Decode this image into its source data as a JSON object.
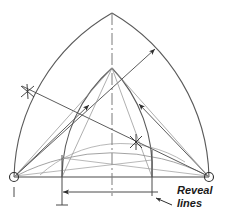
{
  "figure": {
    "type": "technical-line-drawing",
    "width": 225,
    "height": 217,
    "background_color": "#ffffff",
    "line_color": "#4a4a4a",
    "dark_line_color": "#2e2e2e",
    "light_line_color": "#8c8c8c",
    "text_color": "#1a1a1a"
  },
  "annotations": {
    "reveal_label_line1": "Reveal",
    "reveal_label_line2": "lines"
  },
  "geometry": {
    "baseline": {
      "y": 177,
      "x_left": 14,
      "x_right": 209
    },
    "centerline": {
      "x": 112,
      "y_top": 13,
      "y_bottom": 196
    },
    "apex": {
      "x": 112,
      "y": 13
    },
    "inner_apex": {
      "x": 112,
      "y": 68
    },
    "left_center": {
      "x": 14,
      "y": 177
    },
    "right_center": {
      "x": 209,
      "y": 177
    },
    "left_reveal": {
      "x": 62,
      "y": 177
    },
    "right_reveal": {
      "x": 152,
      "y": 177
    },
    "dimension_line_y": 192,
    "extension_bottom_y": 205
  },
  "markers": {
    "center_dot_radius": 4.5,
    "tick_cross_positions": [
      {
        "x": 28,
        "y": 92
      },
      {
        "x": 136,
        "y": 142
      }
    ],
    "arrowheads": [
      {
        "x": 152,
        "y": 52,
        "label": "outer-radius-arrow-right"
      },
      {
        "x": 86,
        "y": 108,
        "label": "inner-radius-arrow-left"
      },
      {
        "x": 136,
        "y": 107,
        "label": "inner-radius-arrow-right"
      },
      {
        "x": 63,
        "y": 192,
        "label": "dimension-arrow-left"
      },
      {
        "x": 157,
        "y": 201,
        "label": "reveal-leader-arrow"
      }
    ]
  }
}
